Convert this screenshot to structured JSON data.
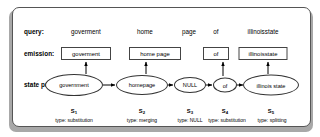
{
  "figure": {
    "row_labels": {
      "query": "query:",
      "emission": "emission:",
      "state_path": "state path:"
    },
    "query_terms": [
      {
        "text": "goverment",
        "x": 86
      },
      {
        "text": "home",
        "x": 145
      },
      {
        "text": "page",
        "x": 189
      },
      {
        "text": "of",
        "x": 216
      },
      {
        "text": "illinoisstate",
        "x": 263
      }
    ],
    "emissions": [
      {
        "text": "goverment",
        "x": 86,
        "w": 50
      },
      {
        "text": "home  page",
        "x": 155,
        "w": 52
      },
      {
        "text": "of",
        "x": 216,
        "w": 26
      },
      {
        "text": "illinoisstate",
        "x": 263,
        "w": 49
      }
    ],
    "states": [
      {
        "label": "government",
        "name": "S",
        "index": "1",
        "type": "type: substitution",
        "x": 74,
        "w": 58,
        "h": 22
      },
      {
        "label": "homepage",
        "name": "S",
        "index": "2",
        "type": "type: merging",
        "x": 142,
        "w": 52,
        "h": 20
      },
      {
        "label": "NULL",
        "name": "S",
        "index": "3",
        "type": "type: NULL",
        "x": 190,
        "w": 32,
        "h": 16
      },
      {
        "label": "of",
        "name": "S",
        "index": "4",
        "type": "type: substitution",
        "x": 225,
        "w": 24,
        "h": 15
      },
      {
        "label": "illinois state",
        "name": "S",
        "index": "5",
        "type": "type: splitting",
        "x": 271,
        "w": 56,
        "h": 21
      }
    ],
    "colors": {
      "panel_border": "#555555",
      "panel_background": "#ffffff",
      "shadow": "#a8a8a8",
      "stroke": "#000000",
      "box_border": "#444444"
    }
  }
}
